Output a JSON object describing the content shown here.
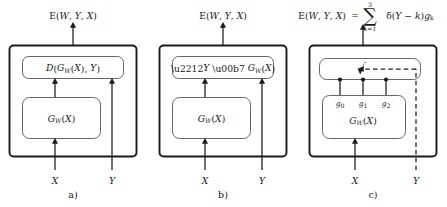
{
  "figure": {
    "panels": [
      {
        "caption": "a)",
        "output_label": "E(W, Y, X)",
        "top_module_label": "D(G_W(X), Y)",
        "bottom_module_label": "G_W(X)",
        "input_x_label": "X",
        "input_y_label": "Y",
        "y_line_style": "solid"
      },
      {
        "caption": "b)",
        "output_label": "E(W, Y, X)",
        "top_module_label": "−Y · G_W(X)",
        "bottom_module_label": "G_W(X)",
        "input_x_label": "X",
        "input_y_label": "Y",
        "y_line_style": "solid"
      },
      {
        "caption": "c)",
        "output_label": "E(W, Y, X) = ∑(k=1..3) δ(Y − k) g_k",
        "output_formula": {
          "lhs": "E(W, Y, X)",
          "equals": "=",
          "sum_symbol": "∑",
          "sum_upper": "3",
          "sum_lower": "k=1",
          "summand": "δ(Y − k)g_k"
        },
        "top_module_label": "switch",
        "bottom_module_label": "G_W(X)",
        "contact_labels": [
          "g_0",
          "g_1",
          "g_2"
        ],
        "input_x_label": "X",
        "input_y_label": "Y",
        "y_line_style": "dashed"
      }
    ],
    "colors": {
      "ink": "#1a1a1a",
      "inner_stroke": "#555555",
      "background": "#ffffff"
    }
  }
}
